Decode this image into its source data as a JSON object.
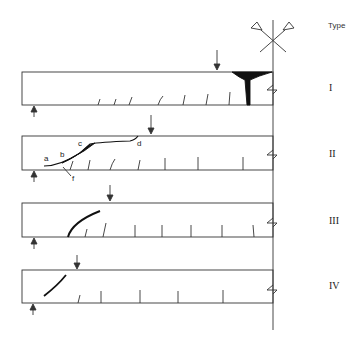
{
  "header": {
    "type_label": "Type"
  },
  "symbol": {
    "name": "fixed-support-cross-symbol"
  },
  "beams": [
    {
      "type": "I",
      "description": "Flexural crack at support (column face) with vertical cracks along span"
    },
    {
      "type": "II",
      "description": "Diagonal shear crack a-b-c-d propagating from support to load point"
    },
    {
      "type": "III",
      "description": "Diagonal crack from support bearing region toward load"
    },
    {
      "type": "IV",
      "description": "Short diagonal crack near support"
    }
  ],
  "crack_point_labels": [
    "a",
    "b",
    "c",
    "d",
    "f"
  ],
  "types_roman": [
    "I",
    "II",
    "III",
    "IV"
  ]
}
